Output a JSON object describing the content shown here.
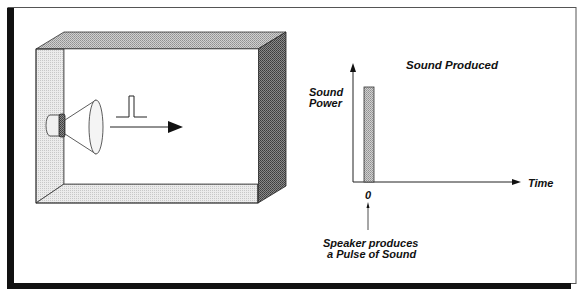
{
  "diagram": {
    "room": {
      "description": "Rectangular room with speaker mounted on left wall emitting a sound pulse",
      "pulse_symbol": "single rectangular pulse",
      "arrow": "right-pointing arrow indicating propagation"
    },
    "graph": {
      "title": "Sound Produced",
      "y_label_line1": "Sound",
      "y_label_line2": "Power",
      "x_label": "Time",
      "x_tick": "0",
      "annotation_line1": "Speaker produces",
      "annotation_line2": "a Pulse of Sound"
    },
    "colors": {
      "frame": "#111111",
      "wall_light": "#e2e2e2",
      "wall_mid": "#b8b8b8",
      "wall_dark": "#6a6a6a",
      "bar": "#bdbdbd"
    }
  }
}
